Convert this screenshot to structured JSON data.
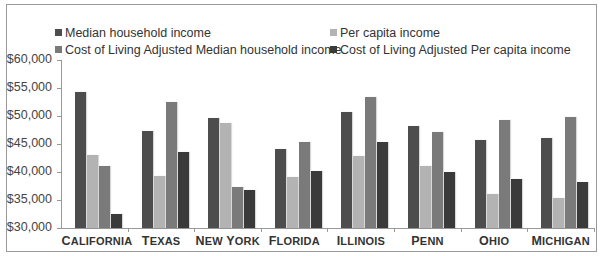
{
  "chart_data": {
    "type": "bar",
    "title": "",
    "xlabel": "",
    "ylabel": "",
    "ylim": [
      30000,
      60000
    ],
    "yticks": [
      "$30,000",
      "$35,000",
      "$40,000",
      "$45,000",
      "$50,000",
      "$55,000",
      "$60,000"
    ],
    "grid": false,
    "legend_position": "top",
    "categories": [
      "California",
      "Texas",
      "New York",
      "Florida",
      "Illinois",
      "Penn",
      "Ohio",
      "Michigan"
    ],
    "category_labels": [
      [
        "C",
        "ALIFORNIA"
      ],
      [
        "T",
        "EXAS"
      ],
      [
        "N",
        "EW ",
        "Y",
        "ORK"
      ],
      [
        "F",
        "LORIDA"
      ],
      [
        "I",
        "LLINOIS"
      ],
      [
        "P",
        "ENN"
      ],
      [
        "O",
        "HIO"
      ],
      [
        "M",
        "ICHIGAN"
      ]
    ],
    "series": [
      {
        "name": "Median household income",
        "color": "#4d4d4d",
        "values": [
          54300,
          47300,
          49700,
          44100,
          50700,
          48300,
          45800,
          46100
        ]
      },
      {
        "name": "Per capita income",
        "color": "#b3b3b3",
        "values": [
          43000,
          39300,
          48700,
          39100,
          42900,
          41000,
          36100,
          35400
        ]
      },
      {
        "name": "Cost of Living Adjusted Median household income",
        "color": "#7a7a7a",
        "values": [
          41000,
          52500,
          37400,
          45300,
          53400,
          47100,
          49200,
          49900
        ]
      },
      {
        "name": "Cost of Living Adjusted Per capita income",
        "color": "#3a3a3a",
        "values": [
          32500,
          43600,
          36700,
          40200,
          45400,
          40000,
          38700,
          38200
        ]
      }
    ]
  },
  "legend": {
    "items": [
      "Median household income",
      "Per capita income",
      "Cost of Living Adjusted Median household income",
      "Cost of Living Adjusted Per capita income"
    ]
  }
}
